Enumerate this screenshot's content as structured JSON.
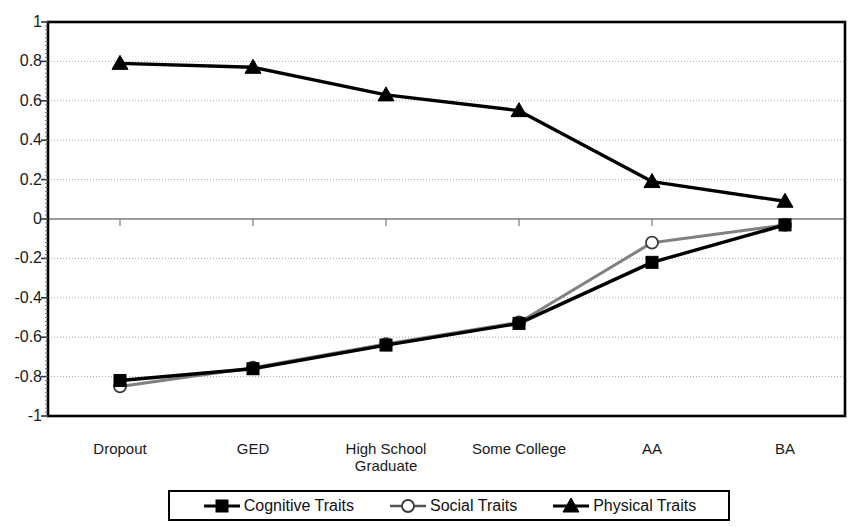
{
  "chart_data": {
    "type": "line",
    "title": "",
    "xlabel": "",
    "ylabel": "",
    "ylim": [
      -1,
      1
    ],
    "ytick_step": 0.2,
    "grid": true,
    "legend_position": "bottom",
    "categories": [
      "Dropout",
      "GED",
      "High School Graduate",
      "Some College",
      "AA",
      "BA"
    ],
    "category_lines": [
      [
        "Dropout"
      ],
      [
        "GED"
      ],
      [
        "High School",
        "Graduate"
      ],
      [
        "Some College"
      ],
      [
        "AA"
      ],
      [
        "BA"
      ]
    ],
    "ytick_labels": [
      "1",
      "0.8",
      "0.6",
      "0.4",
      "0.2",
      "0",
      "-0.2",
      "-0.4",
      "-0.6",
      "-0.8",
      "-1"
    ],
    "ytick_values": [
      1,
      0.8,
      0.6,
      0.4,
      0.2,
      0,
      -0.2,
      -0.4,
      -0.6,
      -0.8,
      -1
    ],
    "series": [
      {
        "name": "Cognitive Traits",
        "marker": "filled-square",
        "color": "#000000",
        "values": [
          -0.82,
          -0.76,
          -0.64,
          -0.53,
          -0.22,
          -0.03
        ]
      },
      {
        "name": "Social Traits",
        "marker": "open-circle",
        "color": "#808080",
        "values": [
          -0.85,
          -0.755,
          -0.635,
          -0.525,
          -0.12,
          -0.03
        ]
      },
      {
        "name": "Physical Traits",
        "marker": "filled-triangle",
        "color": "#000000",
        "values": [
          0.79,
          0.77,
          0.63,
          0.55,
          0.19,
          0.09
        ]
      }
    ]
  },
  "legend": {
    "entries": [
      {
        "label": "Cognitive Traits",
        "marker": "filled-square"
      },
      {
        "label": "Social Traits",
        "marker": "open-circle"
      },
      {
        "label": "Physical Traits",
        "marker": "filled-triangle"
      }
    ]
  },
  "watermark": {
    "text": ""
  }
}
